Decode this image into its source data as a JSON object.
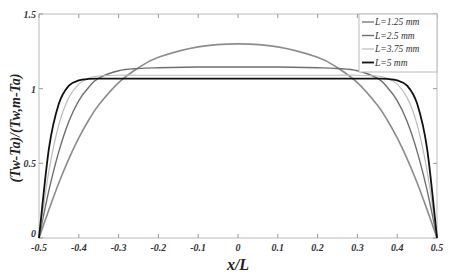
{
  "chart_data": {
    "type": "line",
    "title": "",
    "xlabel": "x/L",
    "ylabel": "(Tw-Ta)/(Tw,m-Ta)",
    "xlim": [
      -0.5,
      0.5
    ],
    "ylim": [
      0,
      1.5
    ],
    "xticks": [
      "-0.5",
      "-0.4",
      "-0.3",
      "-0.2",
      "-0.1",
      "0",
      "0.1",
      "0.2",
      "0.3",
      "0.4",
      "0.5"
    ],
    "yticks": [
      "0",
      "0.5",
      "1",
      "1.5"
    ],
    "grid": false,
    "legend_position": "upper right",
    "x": [
      -0.5,
      -0.475,
      -0.45,
      -0.425,
      -0.4,
      -0.375,
      -0.35,
      -0.3,
      -0.25,
      -0.2,
      -0.1,
      0,
      0.1,
      0.2,
      0.25,
      0.3,
      0.35,
      0.375,
      0.4,
      0.425,
      0.45,
      0.475,
      0.5
    ],
    "series": [
      {
        "name": "L=1.25 mm",
        "color": "#8c8c8c",
        "width": 1.6,
        "values": [
          0,
          0.19,
          0.37,
          0.53,
          0.67,
          0.79,
          0.89,
          1.04,
          1.14,
          1.21,
          1.28,
          1.3,
          1.28,
          1.21,
          1.14,
          1.04,
          0.89,
          0.79,
          0.67,
          0.53,
          0.37,
          0.19,
          0
        ]
      },
      {
        "name": "L=2.5 mm",
        "color": "#6f6f6f",
        "width": 1.4,
        "values": [
          0,
          0.32,
          0.58,
          0.78,
          0.92,
          1.01,
          1.07,
          1.12,
          1.135,
          1.14,
          1.145,
          1.145,
          1.145,
          1.14,
          1.135,
          1.12,
          1.07,
          1.01,
          0.92,
          0.78,
          0.58,
          0.32,
          0
        ]
      },
      {
        "name": "L=3.75 mm",
        "color": "#bdbdbd",
        "width": 1.2,
        "values": [
          0,
          0.45,
          0.76,
          0.94,
          1.03,
          1.07,
          1.085,
          1.09,
          1.09,
          1.09,
          1.09,
          1.09,
          1.09,
          1.09,
          1.09,
          1.09,
          1.085,
          1.07,
          1.03,
          0.94,
          0.76,
          0.45,
          0
        ]
      },
      {
        "name": "L=5 mm",
        "color": "#111111",
        "width": 1.8,
        "values": [
          0,
          0.6,
          0.9,
          1.02,
          1.055,
          1.065,
          1.067,
          1.067,
          1.067,
          1.067,
          1.067,
          1.067,
          1.067,
          1.067,
          1.067,
          1.067,
          1.067,
          1.065,
          1.055,
          1.02,
          0.9,
          0.6,
          0
        ]
      }
    ]
  }
}
